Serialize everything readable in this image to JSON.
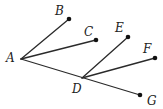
{
  "diagram": {
    "type": "ray-segments",
    "colors": {
      "line": "#2a2a2a",
      "dot": "#111111",
      "label": "#222222",
      "background": "#ffffff"
    },
    "points": [
      {
        "id": "A",
        "label": "A",
        "x": 21,
        "y": 59,
        "lx": 6,
        "ly": 62,
        "dot": false
      },
      {
        "id": "B",
        "label": "B",
        "x": 69,
        "y": 19,
        "lx": 55,
        "ly": 15,
        "dot": true
      },
      {
        "id": "C",
        "label": "C",
        "x": 96,
        "y": 40,
        "lx": 84,
        "ly": 36,
        "dot": true
      },
      {
        "id": "D",
        "label": "D",
        "x": 82,
        "y": 78,
        "lx": 72,
        "ly": 93,
        "dot": false
      },
      {
        "id": "E",
        "label": "E",
        "x": 128,
        "y": 37,
        "lx": 115,
        "ly": 32,
        "dot": true
      },
      {
        "id": "F",
        "label": "F",
        "x": 155,
        "y": 58,
        "lx": 143,
        "ly": 53,
        "dot": true
      },
      {
        "id": "G",
        "label": "G",
        "x": 140,
        "y": 95,
        "lx": 147,
        "ly": 105,
        "dot": true
      }
    ],
    "segments": [
      [
        "A",
        "B"
      ],
      [
        "A",
        "C"
      ],
      [
        "A",
        "G"
      ],
      [
        "D",
        "E"
      ],
      [
        "D",
        "F"
      ]
    ]
  }
}
